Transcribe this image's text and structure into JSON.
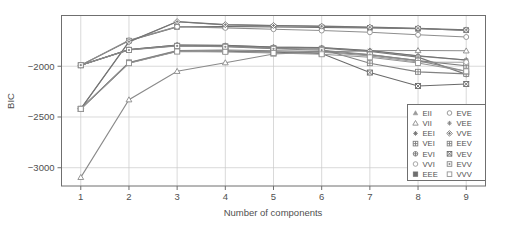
{
  "chart_data": {
    "type": "line",
    "title": "",
    "xlabel": "Number of components",
    "ylabel": "BIC",
    "x": [
      1,
      2,
      3,
      4,
      5,
      6,
      7,
      8,
      9
    ],
    "xticklabels": [
      "1",
      "2",
      "3",
      "4",
      "5",
      "6",
      "7",
      "8",
      "9"
    ],
    "yticklabels": [
      "-2000",
      "-2500",
      "-3000"
    ],
    "yticks": [
      -2000,
      -2500,
      -3000
    ],
    "xlim": [
      0.6,
      9.4
    ],
    "ylim": [
      -3180,
      -1500
    ],
    "grid": true,
    "legend_position": "bottom-right",
    "legend_columns": 2,
    "series": [
      {
        "name": "EII",
        "marker": "triangle-up-filled",
        "color": "#9a9a9a",
        "values": [
          -1990,
          -1835,
          -1790,
          -1795,
          -1812,
          -1818,
          -1848,
          -1900,
          -1940
        ]
      },
      {
        "name": "VII",
        "marker": "triangle-up-open",
        "color": "#8a8a8a",
        "values": [
          -3095,
          -2330,
          -2050,
          -1965,
          -1880,
          -1858,
          -1848,
          -1845,
          -1848
        ]
      },
      {
        "name": "EEI",
        "marker": "asterisk-filled",
        "color": "#707070",
        "values": [
          -1990,
          -1835,
          -1790,
          -1793,
          -1810,
          -1815,
          -1845,
          -1897,
          -1938
        ]
      },
      {
        "name": "VEI",
        "marker": "square-hatch",
        "color": "#7d7d7d",
        "values": [
          -2420,
          -1962,
          -1845,
          -1840,
          -1848,
          -1856,
          -1888,
          -1945,
          -1995
        ]
      },
      {
        "name": "EVI",
        "marker": "circle-cross",
        "color": "#787878",
        "values": [
          -1990,
          -1838,
          -1795,
          -1800,
          -1815,
          -1822,
          -1855,
          -1910,
          -2080
        ]
      },
      {
        "name": "VVI",
        "marker": "circle-open",
        "color": "#9c9c9c",
        "values": [
          -2420,
          -1965,
          -1850,
          -1848,
          -1855,
          -1862,
          -1898,
          -1958,
          -1960
        ]
      },
      {
        "name": "EEE",
        "marker": "square-filled",
        "color": "#6e6e6e",
        "values": [
          -1990,
          -1748,
          -1612,
          -1608,
          -1612,
          -1618,
          -1622,
          -1630,
          -1645
        ]
      },
      {
        "name": "EVE",
        "marker": "circle-open2",
        "color": "#8e8e8e",
        "values": [
          -1990,
          -1745,
          -1610,
          -1622,
          -1635,
          -1648,
          -1665,
          -1690,
          -1712
        ]
      },
      {
        "name": "VEE",
        "marker": "asterisk-open",
        "color": "#858585",
        "values": [
          -2420,
          -1760,
          -1562,
          -1592,
          -1600,
          -1608,
          -1618,
          -1628,
          -1648
        ]
      },
      {
        "name": "VVE",
        "marker": "diamond-cross",
        "color": "#757575",
        "values": [
          -2420,
          -1758,
          -1560,
          -1590,
          -1598,
          -1605,
          -1615,
          -1625,
          -1642
        ]
      },
      {
        "name": "EEV",
        "marker": "square-grid",
        "color": "#828282",
        "values": [
          -1990,
          -1838,
          -1798,
          -1805,
          -1822,
          -1832,
          -1970,
          -2055,
          -2075
        ]
      },
      {
        "name": "VEV",
        "marker": "square-x",
        "color": "#6a6a6a",
        "values": [
          -2420,
          -1968,
          -1852,
          -1852,
          -1862,
          -1875,
          -2062,
          -2195,
          -2175
        ]
      },
      {
        "name": "EVV",
        "marker": "square-dot",
        "color": "#888888",
        "values": [
          -1990,
          -1840,
          -1800,
          -1808,
          -1828,
          -1842,
          -1885,
          -1945,
          -2050
        ]
      },
      {
        "name": "VVV",
        "marker": "square-open",
        "color": "#949494",
        "values": [
          -2420,
          -1970,
          -1855,
          -1858,
          -1870,
          -1882,
          -1912,
          -1968,
          -2050
        ]
      }
    ],
    "legend_left_column": [
      "EII",
      "VII",
      "EEI",
      "VEI",
      "EVI",
      "VVI",
      "EEE"
    ],
    "legend_right_column": [
      "EVE",
      "VEE",
      "VVE",
      "EEV",
      "VEV",
      "EVV",
      "VVV"
    ],
    "colors": {
      "axis": "#6f6f6f",
      "grid": "#c9c9c9",
      "text": "#4f4f4f",
      "background": "#ffffff",
      "series_default": "#808080"
    }
  }
}
